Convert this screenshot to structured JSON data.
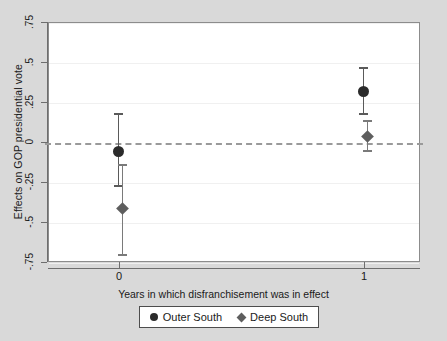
{
  "chart_data": {
    "type": "scatter",
    "title": "",
    "xlabel": "Years in which disfranchisement was in effect",
    "ylabel": "Effects on GOP  presidential vote",
    "x": [
      0,
      1
    ],
    "xtick_labels": [
      "0",
      "1"
    ],
    "ytick_labels": [
      ".75",
      ".5",
      ".25",
      "0",
      "-.25",
      "-.5",
      "-.75"
    ],
    "ytick_values": [
      0.75,
      0.5,
      0.25,
      0,
      -0.25,
      -0.5,
      -0.75
    ],
    "ylim": [
      -0.75,
      0.75
    ],
    "grid": true,
    "legend_position": "bottom-center",
    "reference_line": {
      "value": 0,
      "style": "dashed",
      "color": "#9a9a9a"
    },
    "series": [
      {
        "name": "Outer South",
        "marker": "circle",
        "color": "#2b2b2b",
        "points": [
          {
            "x": 0,
            "value": -0.05,
            "ci_low": -0.27,
            "ci_high": 0.18
          },
          {
            "x": 1,
            "value": 0.32,
            "ci_low": 0.18,
            "ci_high": 0.47
          }
        ]
      },
      {
        "name": "Deep South",
        "marker": "diamond",
        "color": "#5e5e5e",
        "points": [
          {
            "x": 0,
            "value": -0.41,
            "ci_low": -0.7,
            "ci_high": -0.14
          },
          {
            "x": 1,
            "value": 0.04,
            "ci_low": -0.05,
            "ci_high": 0.14
          }
        ]
      }
    ]
  },
  "legend": {
    "entries": [
      {
        "label": "Outer South",
        "marker": "circle"
      },
      {
        "label": "Deep South",
        "marker": "diamond"
      }
    ]
  },
  "colors": {
    "figure_background": "#d9d9d9",
    "plot_background": "#ffffff",
    "axis": "#6e6e6e",
    "grid": "#f0f0f0",
    "outer_south": "#2b2b2b",
    "deep_south": "#5e5e5e"
  }
}
